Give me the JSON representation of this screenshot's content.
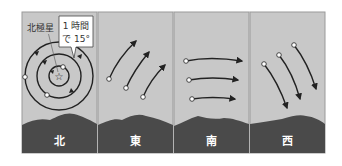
{
  "colors": {
    "sky": "#c8c8c8",
    "ground": "#4a4a4a",
    "line": "#222222",
    "border": "#9a9a9a",
    "point": "#ffffff",
    "callout_bg": "#ffffff"
  },
  "panels": [
    {
      "id": "north",
      "label": "北"
    },
    {
      "id": "east",
      "label": "東"
    },
    {
      "id": "south",
      "label": "南"
    },
    {
      "id": "west",
      "label": "西"
    }
  ],
  "north": {
    "polaris_label": "北極星",
    "callout_line1": "1 時間",
    "callout_line2": "で 15°"
  }
}
